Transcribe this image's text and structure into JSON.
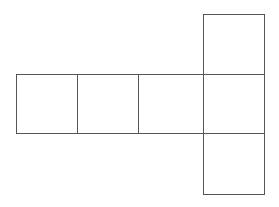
{
  "diagram": {
    "type": "cube-net",
    "stroke_color": "#555555",
    "background": "#ffffff",
    "squares": [
      {
        "name": "face-left-1",
        "x": 16.5,
        "y": 74.5,
        "w": 61,
        "h": 59
      },
      {
        "name": "face-left-2",
        "x": 77.5,
        "y": 74.5,
        "w": 61,
        "h": 59
      },
      {
        "name": "face-left-3",
        "x": 138.5,
        "y": 74.5,
        "w": 65,
        "h": 59
      },
      {
        "name": "face-center",
        "x": 203.5,
        "y": 74.5,
        "w": 61,
        "h": 59
      },
      {
        "name": "face-top",
        "x": 203.5,
        "y": 14.5,
        "w": 61,
        "h": 60
      },
      {
        "name": "face-bottom",
        "x": 203.5,
        "y": 133.5,
        "w": 61,
        "h": 61
      }
    ]
  }
}
